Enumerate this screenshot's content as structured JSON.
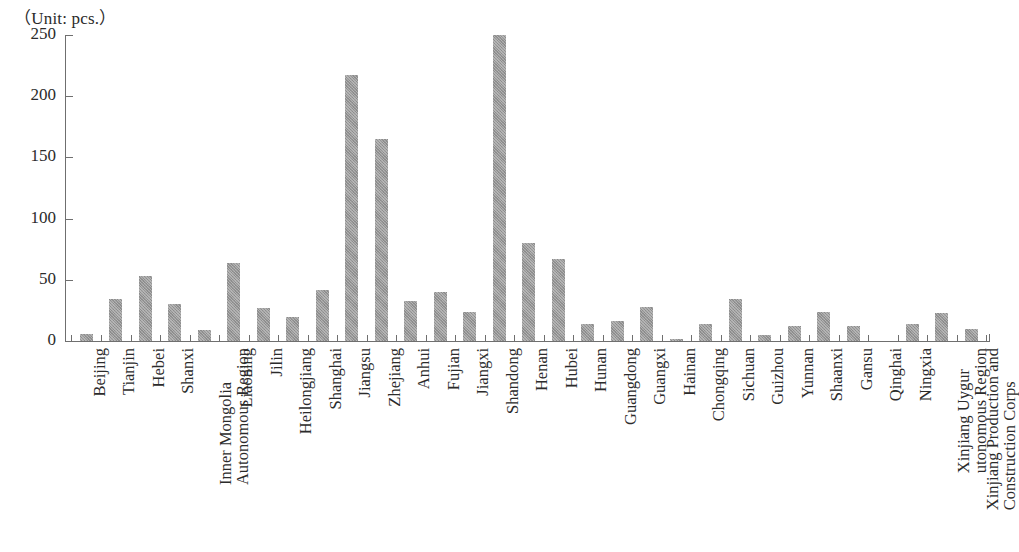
{
  "unit_caption": "（Unit: pcs.）",
  "colors": {
    "bar_fill": "#979797",
    "axis": "#6f6f6f",
    "text": "#2b2b2b",
    "background": "#ffffff"
  },
  "chart_data": {
    "type": "bar",
    "title": "",
    "subtitle": "",
    "unit_label": "（Unit: pcs.）",
    "xlabel": "",
    "ylabel": "",
    "ylim": [
      0,
      250
    ],
    "yticks": [
      0,
      50,
      100,
      150,
      200,
      250
    ],
    "ytick_labels": [
      "0",
      "50",
      "100",
      "150",
      "200",
      "250"
    ],
    "grid": false,
    "legend": null,
    "categories": [
      "Beijing",
      "Tianjin",
      "Hebei",
      "Shanxi",
      "Inner Mongolia Autonomous Region",
      "Liaoning",
      "Jilin",
      "Heilongjiang",
      "Shanghai",
      "Jiangsu",
      "Zhejiang",
      "Anhui",
      "Fujian",
      "Jiangxi",
      "Shandong",
      "Henan",
      "Hubei",
      "Hunan",
      "Guangdong",
      "Guangxi",
      "Hainan",
      "Chongqing",
      "Sichuan",
      "Guizhou",
      "Yunnan",
      "Shaanxi",
      "Gansu",
      "Qinghai",
      "Ningxia",
      "Xinjiang Uygur utonomous Region",
      "Xinjiang Production and Construction Corps"
    ],
    "category_label_lines": [
      [
        "Beijing"
      ],
      [
        "Tianjin"
      ],
      [
        "Hebei"
      ],
      [
        "Shanxi"
      ],
      [
        "Inner Mongolia",
        "Autonomous Region"
      ],
      [
        "Liaoning"
      ],
      [
        "Jilin"
      ],
      [
        "Heilongjiang"
      ],
      [
        "Shanghai"
      ],
      [
        "Jiangsu"
      ],
      [
        "Zhejiang"
      ],
      [
        "Anhui"
      ],
      [
        "Fujian"
      ],
      [
        "Jiangxi"
      ],
      [
        "Shandong"
      ],
      [
        "Henan"
      ],
      [
        "Hubei"
      ],
      [
        "Hunan"
      ],
      [
        "Guangdong"
      ],
      [
        "Guangxi"
      ],
      [
        "Hainan"
      ],
      [
        "Chongqing"
      ],
      [
        "Sichuan"
      ],
      [
        "Guizhou"
      ],
      [
        "Yunnan"
      ],
      [
        "Shaanxi"
      ],
      [
        "Gansu"
      ],
      [
        "Qinghai"
      ],
      [
        "Ningxia"
      ],
      [
        "Xinjiang Uygur",
        "utonomous Region"
      ],
      [
        "Xinjiang Production and",
        "Construction Corps"
      ]
    ],
    "values": [
      6,
      34,
      53,
      30,
      9,
      64,
      27,
      20,
      42,
      217,
      165,
      33,
      40,
      24,
      250,
      80,
      67,
      14,
      16,
      28,
      2,
      14,
      34,
      5,
      12,
      24,
      12,
      0,
      14,
      23,
      10
    ]
  }
}
